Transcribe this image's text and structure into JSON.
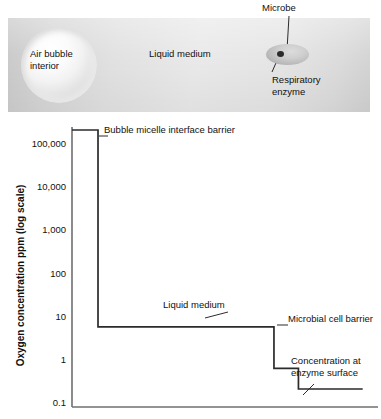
{
  "illustration": {
    "bubble_label": "Air bubble interior",
    "liquid_label": "Liquid medium",
    "microbe_label": "Microbe",
    "enzyme_label": "Respiratory enzyme",
    "colors": {
      "panel_light": "#eaeaea",
      "panel_dark": "#c9c9c9",
      "microbe_fill": "#bdbdbd",
      "enzyme_fill": "#2a2a2a"
    }
  },
  "chart_data": {
    "type": "line",
    "title": "",
    "xlabel": "",
    "ylabel": "Oxygen concentration ppm (log scale)",
    "y_scale": "log",
    "ylim": [
      0.1,
      300000
    ],
    "grid": false,
    "legend": "none",
    "y_ticks": [
      "100,000",
      "10,000",
      "1,000",
      "100",
      "10",
      "1",
      "0.1"
    ],
    "y_tick_values": [
      100000,
      10000,
      1000,
      100,
      10,
      1,
      0.1
    ],
    "x_axis_visible": true,
    "x_ticks": [],
    "series": [
      {
        "name": "Oxygen concentration profile",
        "x": [
          0,
          8.5,
          8.5,
          66,
          66,
          74,
          74,
          95
        ],
        "values": [
          200000,
          200000,
          5.5,
          5.5,
          0.6,
          0.6,
          0.2,
          0.2
        ],
        "step_description": "Step-down profile from bubble interior through liquid medium to enzyme surface"
      }
    ],
    "annotations": [
      {
        "text": "Bubble micelle interface barrier",
        "x_pct": 27,
        "y_px": 4
      },
      {
        "text": "Liquid medium",
        "x_pct": 42,
        "y_px": 180
      },
      {
        "text": "Microbial cell barrier",
        "x_pct": 76,
        "y_px": 197
      },
      {
        "text": "Concentration at enzyme surface",
        "x_pct": 78,
        "y_px": 240
      }
    ]
  },
  "annotation_text": {
    "bubble_barrier": "Bubble micelle interface barrier",
    "liquid_medium": "Liquid medium",
    "cell_barrier": "Microbial cell barrier",
    "enzyme_conc_line1": "Concentration at",
    "enzyme_conc_line2": "enzyme surface"
  }
}
